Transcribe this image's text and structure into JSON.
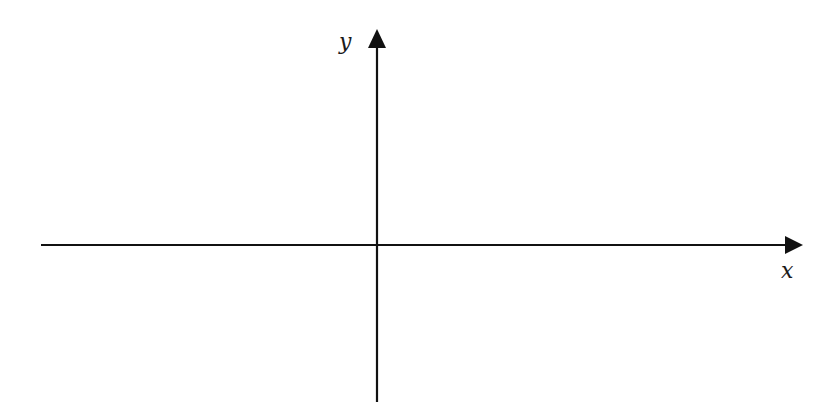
{
  "diagram": {
    "type": "cartesian-axes",
    "x_axis": {
      "label": "x",
      "direction": "right",
      "arrowhead": true
    },
    "y_axis": {
      "label": "y",
      "direction": "up",
      "arrowhead": true
    },
    "colors": {
      "axis": "#111111",
      "label": "#1a1a1a",
      "background": "#ffffff"
    }
  }
}
